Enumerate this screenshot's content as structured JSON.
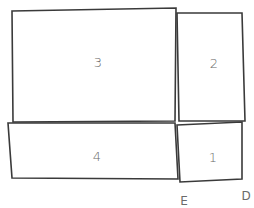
{
  "diagram": {
    "shapes": [
      {
        "id": "3",
        "label": "3",
        "points": "12,11 176,8 175,121 13,122",
        "label_pos": [
          98,
          63
        ]
      },
      {
        "id": "2",
        "label": "2",
        "points": "177,13 242,13 245,121 179,121",
        "label_pos": [
          214,
          64
        ]
      },
      {
        "id": "4",
        "label": "4",
        "points": "8,123 175,123 178,179 12,178",
        "label_pos": [
          97,
          157
        ]
      },
      {
        "id": "1",
        "label": "1",
        "points": "177,125 242,122 242,179 180,182",
        "label_pos": [
          213,
          158
        ]
      }
    ],
    "points": [
      {
        "id": "E",
        "label": "E",
        "pos": [
          184,
          201
        ]
      },
      {
        "id": "D",
        "label": "D",
        "pos": [
          246,
          196
        ]
      }
    ],
    "colors": {
      "stroke": "#3a3a3a",
      "label": "#6a6a6a",
      "background": "#ffffff"
    }
  }
}
